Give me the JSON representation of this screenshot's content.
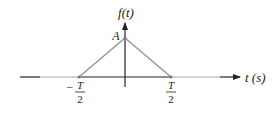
{
  "diagram": {
    "type": "triangular-pulse",
    "y_axis_label": "f(t)",
    "x_axis_label": "t (s)",
    "peak_label": "A",
    "left_tick": {
      "sign": "−",
      "numerator": "T",
      "denominator": "2"
    },
    "right_tick": {
      "numerator": "T",
      "denominator": "2"
    },
    "colors": {
      "axis": "#222222",
      "pulse": "#9a9a9a",
      "axis_light": "#a8a8a8"
    }
  }
}
